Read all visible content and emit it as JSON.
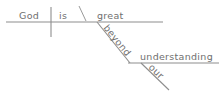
{
  "diagram": {
    "type": "reed-kellogg-sentence-diagram",
    "sentence": "God is great beyond our understanding",
    "colors": {
      "line": "#8e8e8e",
      "text": "#6f6f6f",
      "background": "#ffffff"
    },
    "words": {
      "subject": "God",
      "verb": "is",
      "complement": "great",
      "preposition": "beyond",
      "object_of_preposition": "understanding",
      "modifier": "our"
    }
  }
}
